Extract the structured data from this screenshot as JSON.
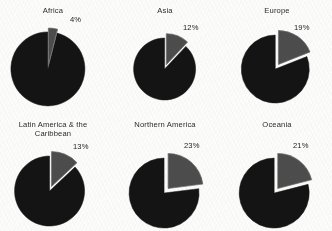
{
  "chart_data": {
    "type": "pie",
    "title": "",
    "subtitle": "",
    "xlabel": "",
    "ylabel": "",
    "legend_position": "none",
    "grid": false,
    "layout": {
      "rows": 2,
      "cols": 3
    },
    "slice_colors": {
      "highlight": "#4d4d4d",
      "remainder": "#141414",
      "gap": "#ffffff",
      "outline": "#6f6f6f"
    },
    "panels": [
      {
        "title": "Africa",
        "title_lines": [
          "Africa"
        ],
        "categories": [
          "Highlighted share",
          "Remainder"
        ],
        "values": [
          4,
          96
        ],
        "labels": [
          "4%",
          ""
        ],
        "highlight_label": "4%",
        "highlight_value": 4,
        "remainder_value": 96
      },
      {
        "title": "Asia",
        "title_lines": [
          "Asia"
        ],
        "categories": [
          "Highlighted share",
          "Remainder"
        ],
        "values": [
          12,
          88
        ],
        "labels": [
          "12%",
          ""
        ],
        "highlight_label": "12%",
        "highlight_value": 12,
        "remainder_value": 88
      },
      {
        "title": "Europe",
        "title_lines": [
          "Europe"
        ],
        "categories": [
          "Highlighted share",
          "Remainder"
        ],
        "values": [
          19,
          81
        ],
        "labels": [
          "19%",
          ""
        ],
        "highlight_label": "19%",
        "highlight_value": 19,
        "remainder_value": 81
      },
      {
        "title": "Latin America & the Caribbean",
        "title_lines": [
          "Latin America & the",
          "Caribbean"
        ],
        "categories": [
          "Highlighted share",
          "Remainder"
        ],
        "values": [
          13,
          87
        ],
        "labels": [
          "13%",
          ""
        ],
        "highlight_label": "13%",
        "highlight_value": 13,
        "remainder_value": 87
      },
      {
        "title": "Northern America",
        "title_lines": [
          "Northern America"
        ],
        "categories": [
          "Highlighted share",
          "Remainder"
        ],
        "values": [
          23,
          77
        ],
        "labels": [
          "23%",
          ""
        ],
        "highlight_label": "23%",
        "highlight_value": 23,
        "remainder_value": 77
      },
      {
        "title": "Oceania",
        "title_lines": [
          "Oceania"
        ],
        "categories": [
          "Highlighted share",
          "Remainder"
        ],
        "values": [
          21,
          79
        ],
        "labels": [
          "21%",
          ""
        ],
        "highlight_label": "21%",
        "highlight_value": 21,
        "remainder_value": 79
      }
    ]
  }
}
